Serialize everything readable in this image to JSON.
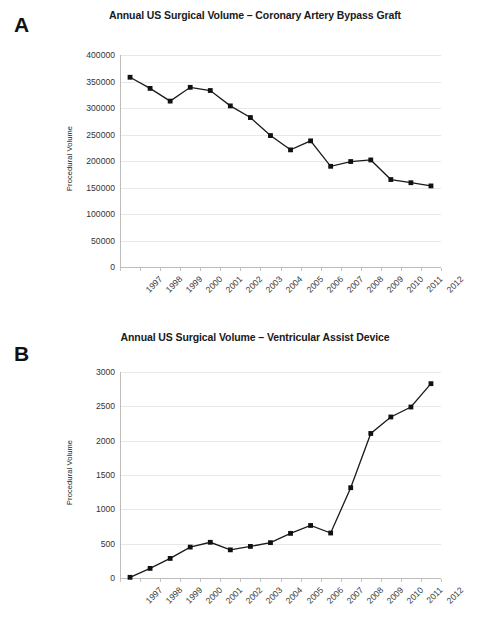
{
  "figure": {
    "panels": [
      {
        "letter": "A",
        "chart_ref": 0
      },
      {
        "letter": "B",
        "chart_ref": 1
      }
    ]
  },
  "chart_data": [
    {
      "type": "line",
      "title": "Annual US Surgical Volume – Coronary Artery Bypass Graft",
      "xlabel": "",
      "ylabel": "Procedural Volume",
      "categories": [
        "1997",
        "1998",
        "1999",
        "2000",
        "2001",
        "2002",
        "2003",
        "2004",
        "2005",
        "2006",
        "2007",
        "2008",
        "2009",
        "2010",
        "2011",
        "2012"
      ],
      "values": [
        358000,
        337000,
        313000,
        339000,
        333000,
        304000,
        282000,
        248000,
        221000,
        238000,
        190000,
        199000,
        202000,
        165000,
        159000,
        153000
      ],
      "ylim": [
        0,
        400000
      ],
      "yticks": [
        0,
        50000,
        100000,
        150000,
        200000,
        250000,
        300000,
        350000,
        400000
      ],
      "ytick_labels": [
        "0",
        "50000",
        "100000",
        "150000",
        "200000",
        "250000",
        "300000",
        "350000",
        "400000"
      ],
      "grid": true,
      "legend": false,
      "marker": "square",
      "line_color": "#1a1a1a",
      "marker_color": "#111111"
    },
    {
      "type": "line",
      "title": "Annual US Surgical Volume – Ventricular Assist Device",
      "xlabel": "",
      "ylabel": "Procedural Volume",
      "categories": [
        "1997",
        "1998",
        "1999",
        "2000",
        "2001",
        "2002",
        "2003",
        "2004",
        "2005",
        "2006",
        "2007",
        "2008",
        "2009",
        "2010",
        "2011",
        "2012"
      ],
      "values": [
        10,
        140,
        285,
        450,
        520,
        410,
        460,
        515,
        650,
        765,
        655,
        1315,
        2105,
        2345,
        2490,
        2830
      ],
      "ylim": [
        0,
        3000
      ],
      "yticks": [
        0,
        500,
        1000,
        1500,
        2000,
        2500,
        3000
      ],
      "ytick_labels": [
        "0",
        "500",
        "1000",
        "1500",
        "2000",
        "2500",
        "3000"
      ],
      "grid": true,
      "legend": false,
      "marker": "square",
      "line_color": "#1a1a1a",
      "marker_color": "#111111"
    }
  ]
}
